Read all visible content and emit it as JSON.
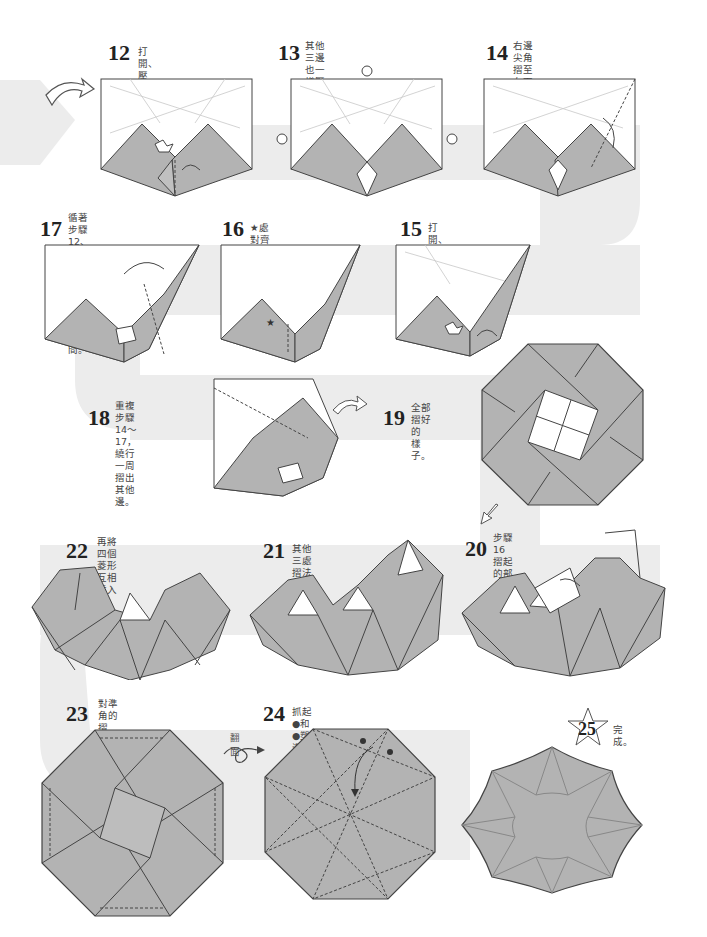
{
  "colors": {
    "paper_fill": "#b3b3b3",
    "flow_band": "#e8e8e8",
    "line": "#444444",
    "crease": "#c8c8c8",
    "background": "#ffffff"
  },
  "steps": [
    {
      "number": "12",
      "caption": "打開、壓平。"
    },
    {
      "number": "13",
      "caption": "其他三邊也一樣壓出同樣的\n摺痕。"
    },
    {
      "number": "14",
      "caption": "右邊尖角摺至左下時，\n連結的右邊也一併摺起。"
    },
    {
      "number": "15",
      "caption": "打開、壓平。"
    },
    {
      "number": "16",
      "caption": "★處對齊摺邊摺好。"
    },
    {
      "number": "17",
      "caption": "循著步驟12、13預先壓好\n的摺痕，將右邊摺向中間。"
    },
    {
      "number": "18",
      "caption": "重複步驟14～17，\n繞行一周摺出其他\n邊。"
    },
    {
      "number": "19",
      "caption": "全部摺好的\n樣子。"
    },
    {
      "number": "20",
      "caption": "步驟16摺起的部分\n向內壓摺。"
    },
    {
      "number": "21",
      "caption": "其他三處摺法一樣。"
    },
    {
      "number": "22",
      "caption": "再將四個菱形\n互相插入嵌合。"
    },
    {
      "number": "23",
      "caption": "對準角的摺邊，\n壓出摺痕。"
    },
    {
      "number": "24",
      "caption": "抓起●和●塑造立體形狀。"
    },
    {
      "number": "25",
      "caption": "完成。"
    }
  ],
  "annotations": {
    "flip_label": "翻面",
    "star_mark": "★"
  },
  "icons": {
    "continue_arrow": "curved-arrow-icon",
    "flip": "flip-over-icon",
    "finish_star": "star-icon"
  }
}
